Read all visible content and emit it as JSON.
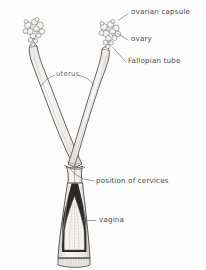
{
  "figure": {
    "width": 206,
    "height": 270,
    "background_color": "#fdfdfd",
    "ink_color": "#3a3a3a",
    "label_color": "#4a4a4a",
    "tissue_fill": "#f2f0ee"
  },
  "labels": [
    {
      "id": "ovarian-capsule",
      "text": "ovarian capsule",
      "x": 131,
      "y": 12
    },
    {
      "id": "ovary",
      "text": "ovary",
      "x": 131,
      "y": 38
    },
    {
      "id": "fallopian-tube",
      "text": "Fallopian tube",
      "x": 128,
      "y": 61
    },
    {
      "id": "uterus",
      "text": "uterus",
      "x": 56,
      "y": 73
    },
    {
      "id": "position-of-cervices",
      "text": "position of cervices",
      "x": 96,
      "y": 180
    },
    {
      "id": "vagina",
      "text": "vagina",
      "x": 99,
      "y": 219
    }
  ],
  "structures": [
    "left ovarian capsule cluster",
    "right ovarian capsule cluster",
    "left uterine horn",
    "right uterine horn",
    "cervix junction",
    "vagina"
  ]
}
